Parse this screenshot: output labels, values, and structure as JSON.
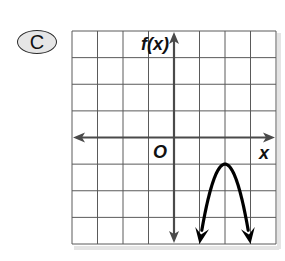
{
  "choice": {
    "label": "C"
  },
  "chart_data": {
    "type": "line",
    "title": "",
    "xlabel": "x",
    "ylabel": "f(x)",
    "origin_label": "O",
    "xlim": [
      -4,
      4
    ],
    "ylim": [
      -4,
      4
    ],
    "grid": true,
    "grid_step": 1,
    "tick_labels": false,
    "legend": null,
    "series": [
      {
        "name": "f(x)",
        "function": "f(x) = -3(x - 2)^2 - 1",
        "description": "Downward-opening parabola with vertex at (2, -1), arrows at both ends",
        "vertex": [
          2,
          -1
        ],
        "x": [
          1.0,
          1.25,
          1.5,
          1.75,
          2.0,
          2.25,
          2.5,
          2.75,
          3.0
        ],
        "y": [
          -4.0,
          -2.69,
          -1.75,
          -1.19,
          -1.0,
          -1.19,
          -1.75,
          -2.69,
          -4.0
        ]
      }
    ]
  },
  "colors": {
    "grid": "#5a5a5a",
    "axis": "#4a4a4a",
    "curve": "#000000",
    "background": "#ffffff",
    "badge_fill": "#e6e6e6"
  }
}
